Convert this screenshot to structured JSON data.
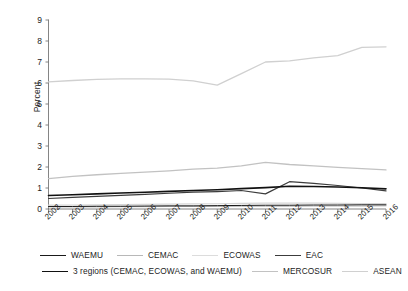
{
  "chart_data": {
    "type": "line",
    "title": "",
    "xlabel": "",
    "ylabel": "Percent",
    "ylim": [
      0,
      9
    ],
    "yticks": [
      0,
      1,
      2,
      3,
      4,
      5,
      6,
      7,
      8,
      9
    ],
    "grid": false,
    "legend_position": "bottom",
    "categories": [
      "2002",
      "2003",
      "2004",
      "2005",
      "2006",
      "2007",
      "2008",
      "2009",
      "2010",
      "2011",
      "2012",
      "2013",
      "2014",
      "2015",
      "2016"
    ],
    "series": [
      {
        "name": "WAEMU",
        "color": "#1a1a1a",
        "width": 1.0,
        "values": [
          0.12,
          0.12,
          0.13,
          0.13,
          0.14,
          0.15,
          0.15,
          0.16,
          0.17,
          0.18,
          0.18,
          0.19,
          0.19,
          0.2,
          0.2
        ]
      },
      {
        "name": "CEMAC",
        "color": "#b8b8b8",
        "width": 1.0,
        "values": [
          0.1,
          0.1,
          0.1,
          0.11,
          0.11,
          0.12,
          0.12,
          0.12,
          0.13,
          0.13,
          0.13,
          0.14,
          0.14,
          0.14,
          0.15
        ]
      },
      {
        "name": "ECOWAS",
        "color": "#d6d6d6",
        "width": 1.2,
        "values": [
          0.18,
          0.19,
          0.2,
          0.21,
          0.22,
          0.23,
          0.24,
          0.25,
          0.27,
          0.28,
          0.28,
          0.28,
          0.27,
          0.26,
          0.26
        ]
      },
      {
        "name": "EAC",
        "color": "#3c3c3c",
        "width": 1.2,
        "values": [
          0.5,
          0.55,
          0.6,
          0.65,
          0.7,
          0.75,
          0.8,
          0.83,
          0.88,
          0.72,
          1.3,
          1.22,
          1.12,
          1.0,
          0.86
        ]
      },
      {
        "name": "3 regions (CEMAC, ECOWAS, and WAEMU)",
        "color": "#111111",
        "width": 1.6,
        "values": [
          0.64,
          0.68,
          0.72,
          0.76,
          0.8,
          0.84,
          0.88,
          0.92,
          0.97,
          1.02,
          1.08,
          1.07,
          1.05,
          1.01,
          0.96
        ]
      },
      {
        "name": "MERCOSUR",
        "color": "#c2c2c2",
        "width": 1.3,
        "values": [
          1.45,
          1.55,
          1.63,
          1.7,
          1.76,
          1.82,
          1.9,
          1.95,
          2.05,
          2.22,
          2.12,
          2.05,
          1.98,
          1.92,
          1.86
        ]
      },
      {
        "name": "ASEAN",
        "color": "#d0d0d0",
        "width": 1.3,
        "values": [
          6.05,
          6.12,
          6.17,
          6.2,
          6.2,
          6.18,
          6.1,
          5.9,
          6.45,
          7.0,
          7.05,
          7.2,
          7.3,
          7.7,
          7.72
        ]
      }
    ]
  },
  "axis": {
    "y_title": "Percent",
    "y_ticks": [
      "0",
      "1",
      "2",
      "3",
      "4",
      "5",
      "6",
      "7",
      "8",
      "9"
    ],
    "x_ticks": [
      "2002",
      "2003",
      "2004",
      "2005",
      "2006",
      "2007",
      "2008",
      "2009",
      "2010",
      "2011",
      "2012",
      "2013",
      "2014",
      "2015",
      "2016"
    ]
  },
  "legend": {
    "row1": [
      {
        "label": "WAEMU",
        "color": "#1a1a1a",
        "width": 1.3
      },
      {
        "label": "CEMAC",
        "color": "#b8b8b8",
        "width": 1.3
      },
      {
        "label": "ECOWAS",
        "color": "#dcdcdc",
        "width": 1.3
      },
      {
        "label": "EAC",
        "color": "#3c3c3c",
        "width": 1.4
      }
    ],
    "row2": [
      {
        "label": "3 regions (CEMAC, ECOWAS, and WAEMU)",
        "color": "#111111",
        "width": 1.8
      },
      {
        "label": "MERCOSUR",
        "color": "#c2c2c2",
        "width": 1.3
      },
      {
        "label": "ASEAN",
        "color": "#d0d0d0",
        "width": 1.3
      }
    ]
  },
  "colors": {
    "axis": "#777777",
    "text": "#1c1c1c",
    "background": "#ffffff"
  }
}
